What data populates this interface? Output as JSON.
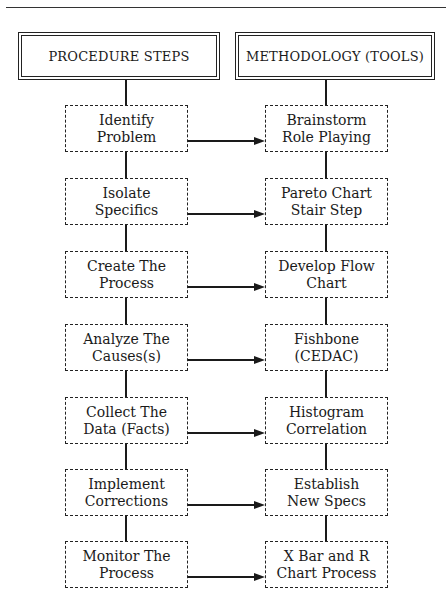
{
  "headers": {
    "left": "PROCEDURE STEPS",
    "right": "METHODOLOGY (TOOLS)"
  },
  "steps": [
    {
      "procedure": [
        "Identify",
        "Problem"
      ],
      "tool": [
        "Brainstorm",
        "Role Playing"
      ]
    },
    {
      "procedure": [
        "Isolate",
        "Specifics"
      ],
      "tool": [
        "Pareto Chart",
        "Stair Step"
      ]
    },
    {
      "procedure": [
        "Create The",
        "Process"
      ],
      "tool": [
        "Develop Flow",
        "Chart"
      ]
    },
    {
      "procedure": [
        "Analyze The",
        "Causes(s)"
      ],
      "tool": [
        "Fishbone",
        "(CEDAC)"
      ]
    },
    {
      "procedure": [
        "Collect The",
        "Data (Facts)"
      ],
      "tool": [
        "Histogram",
        "Correlation"
      ]
    },
    {
      "procedure": [
        "Implement",
        "Corrections"
      ],
      "tool": [
        "Establish",
        "New Specs"
      ]
    },
    {
      "procedure": [
        "Monitor The",
        "Process"
      ],
      "tool": [
        "X Bar and R",
        "Chart Process"
      ]
    }
  ],
  "colors": {
    "line": "#1a1a1a",
    "background": "#ffffff"
  }
}
